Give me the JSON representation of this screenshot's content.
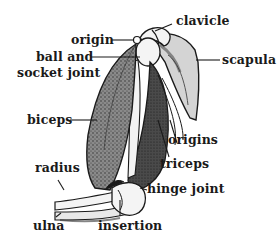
{
  "diagram": {
    "labels": {
      "origin": "origin",
      "ball_and_socket_1": "ball and",
      "ball_and_socket_2": "socket joint",
      "clavicle": "clavicle",
      "scapula": "scapula",
      "biceps": "biceps",
      "origins": "origins",
      "triceps": "triceps",
      "radius": "radius",
      "hinge_joint": "hinge joint",
      "ulna": "ulna",
      "insertion": "insertion"
    },
    "colors": {
      "ink": "#1a1a1a",
      "muscle_shade": "#6a6a6a",
      "bone": "#f4f4f4",
      "scapula": "#d8d8d8",
      "background": "#ffffff"
    }
  }
}
